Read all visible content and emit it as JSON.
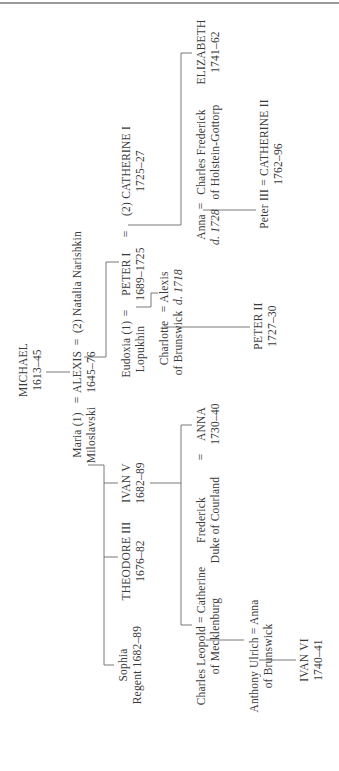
{
  "diagram": {
    "type": "family-tree",
    "orientation": "rotated-90-ccw",
    "line_color": "#6a6a6a",
    "text_color": "#3a3a3a"
  },
  "people": {
    "michael": {
      "name": "MICHAEL",
      "dates": "1613–45"
    },
    "alexis": {
      "name": "ALEXIS",
      "dates": "1645–76"
    },
    "natalia": {
      "name": "(2) Natalia Narishkin"
    },
    "maria": {
      "name": "Maria (1)",
      "line2": "Miloslavski"
    },
    "ivan_v": {
      "name": "IVAN V",
      "dates": "1682–89"
    },
    "theodore_iii": {
      "name": "THEODORE III",
      "dates": "1676–82"
    },
    "sophia": {
      "name": "Sophia",
      "line2": "Regent 1682–89"
    },
    "eudoxia": {
      "name": "Eudoxia (1)",
      "line2": "Lopukhin"
    },
    "peter_i": {
      "name": "PETER I",
      "dates": "1689–1725"
    },
    "catherine_i": {
      "name": "(2) CATHERINE I",
      "dates": "1725–27"
    },
    "charlotte": {
      "name": "Charlotte",
      "line2": "of Brunswick"
    },
    "alexis_jr": {
      "name": "Alexis",
      "line2": "d. 1718"
    },
    "peter_ii": {
      "name": "PETER II",
      "dates": "1727–30"
    },
    "anna_petrovna": {
      "name": "Anna",
      "line2": "d. 1728"
    },
    "charles_frederick": {
      "name": "Charles Frederick",
      "line2": "of Holstein-Gottorp"
    },
    "elizabeth": {
      "name": "ELIZABETH",
      "dates": "1741–62"
    },
    "peter_iii_catherine_ii": {
      "name": "Peter III = CATHERINE II",
      "dates": "1762–96"
    },
    "frederick": {
      "name": "Frederick",
      "line2": "Duke of Courland"
    },
    "anna_ivanovna": {
      "name": "ANNA",
      "dates": "1730–40"
    },
    "charles_leopold_catherine": {
      "name": "Charles Leopold = Catherine",
      "line2": "of Mecklenburg"
    },
    "anthony_anna": {
      "name": "Anthony Ulrich = Anna",
      "line2": "of Brunswick"
    },
    "ivan_vi": {
      "name": "IVAN VI",
      "dates": "1740–41"
    }
  },
  "symbols": {
    "marriage": "="
  }
}
